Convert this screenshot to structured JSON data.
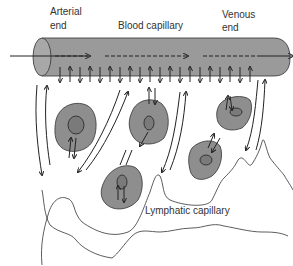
{
  "diagram": {
    "labels": {
      "arterial_line1": "Arterial",
      "arterial_line2": "end",
      "blood_capillary": "Blood capillary",
      "venous_line1": "Venous",
      "venous_line2": "end",
      "lymphatic_capillary": "Lymphatic capillary"
    },
    "colors": {
      "capillary_fill": "#9a9a9a",
      "cell_fill": "#8e8e8e",
      "stroke": "#222222",
      "text": "#333333"
    },
    "elements": {
      "blood_capillary": "horizontal tube with flow arrows (solid in, dashed inside, solid out)",
      "exchange_arrows": "alternating up/down arrows below capillary",
      "tissue_cells": 5,
      "lymphatic_capillary": "irregular outlined vessel at bottom"
    }
  }
}
